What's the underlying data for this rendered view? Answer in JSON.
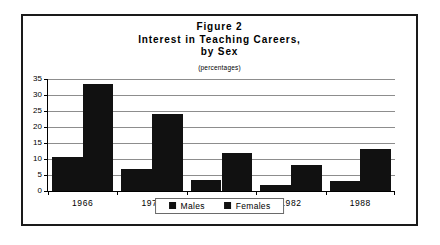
{
  "chart_data": {
    "type": "bar",
    "title": "Figure 2",
    "title_lines": [
      "Figure 2",
      "Interest in Teaching Careers,",
      "by Sex"
    ],
    "subtitle": "(percentages)",
    "xlabel": "",
    "ylabel": "",
    "ylim": [
      0,
      35
    ],
    "yticks": [
      0,
      5,
      10,
      15,
      20,
      25,
      30,
      35
    ],
    "ytick_labels": [
      "0",
      "5",
      "10",
      "15",
      "20",
      "25",
      "30",
      "35"
    ],
    "grid": true,
    "legend_position": "bottom-center",
    "categories": [
      "1966",
      "1971",
      "1976",
      "1982",
      "1988"
    ],
    "series": [
      {
        "name": "Males",
        "color": "#111111",
        "values": [
          10.5,
          7,
          3.5,
          1.8,
          3
        ]
      },
      {
        "name": "Females",
        "color": "#111111",
        "values": [
          33.5,
          24,
          12,
          8,
          13
        ]
      }
    ]
  },
  "legend": {
    "items": [
      {
        "label": "Males"
      },
      {
        "label": "Females"
      }
    ]
  }
}
